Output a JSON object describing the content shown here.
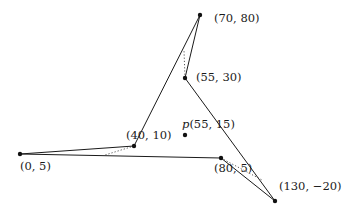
{
  "diagram": {
    "type": "polygon-with-query-point",
    "vertices": [
      {
        "id": "v_70_80",
        "label": "(70, 80)",
        "x": 70,
        "y": 80,
        "px": [
          200,
          15
        ],
        "label_pos": [
          214,
          22
        ]
      },
      {
        "id": "v_55_30",
        "label": "(55, 30)",
        "x": 55,
        "y": 30,
        "px": [
          185,
          78
        ],
        "label_pos": [
          196,
          81
        ]
      },
      {
        "id": "v_130_m20",
        "label": "(130, −20)",
        "x": 130,
        "y": -20,
        "px": [
          275,
          201
        ],
        "label_pos": [
          279,
          190
        ]
      },
      {
        "id": "v_80_5",
        "label": "(80, 5)",
        "x": 80,
        "y": 5,
        "px": [
          221,
          158
        ],
        "label_pos": [
          214,
          172
        ]
      },
      {
        "id": "v_0_5",
        "label": "(0, 5)",
        "x": 0,
        "y": 5,
        "px": [
          20,
          154
        ],
        "label_pos": [
          20,
          170
        ]
      },
      {
        "id": "v_40_10",
        "label": "(40, 10)",
        "x": 40,
        "y": 10,
        "px": [
          134,
          146
        ],
        "label_pos": [
          126,
          139
        ]
      }
    ],
    "edges": [
      [
        "v_70_80",
        "v_55_30"
      ],
      [
        "v_55_30",
        "v_130_m20"
      ],
      [
        "v_130_m20",
        "v_80_5"
      ],
      [
        "v_80_5",
        "v_0_5"
      ],
      [
        "v_0_5",
        "v_40_10"
      ],
      [
        "v_40_10",
        "v_70_80"
      ]
    ],
    "dotted_segments": [
      {
        "from": [
          185,
          78
        ],
        "to": [
          184,
          50
        ]
      },
      {
        "from": [
          134,
          146
        ],
        "to": [
          105,
          155
        ]
      },
      {
        "from": [
          221,
          158
        ],
        "to": [
          262,
          180
        ]
      }
    ],
    "query_point": {
      "id": "p",
      "name": "p",
      "coords": "(55, 15)",
      "x": 55,
      "y": 15,
      "px": [
        185,
        135
      ],
      "label_pos": [
        182,
        128
      ]
    }
  }
}
